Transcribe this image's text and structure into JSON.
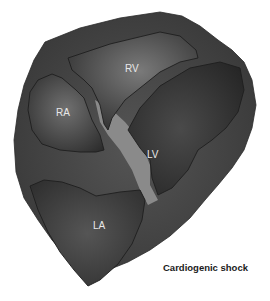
{
  "figure": {
    "caption": "Cardiogenic shock",
    "chambers": [
      {
        "id": "RV",
        "label": "RV"
      },
      {
        "id": "RA",
        "label": "RA"
      },
      {
        "id": "LV",
        "label": "LV"
      },
      {
        "id": "LA",
        "label": "LA"
      }
    ],
    "colors": {
      "background": "#ffffff",
      "myocardium": "#3c3c3c",
      "septum_highlight": "#8a8a8a",
      "chamber_dark": "#2a2a2a",
      "chamber_light": "#6a6a6a",
      "label_text": "#e8e8e8",
      "caption_text": "#1a1a1a"
    }
  }
}
